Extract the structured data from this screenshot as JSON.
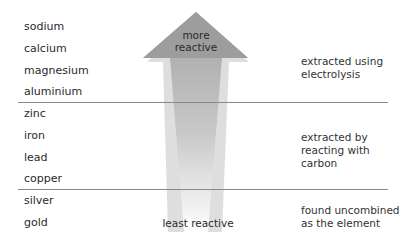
{
  "metals": [
    "sodium",
    "calcium",
    "magnesium",
    "aluminium",
    "zinc",
    "iron",
    "lead",
    "copper",
    "silver",
    "gold"
  ],
  "arrow": {
    "top_label_line1": "more",
    "top_label_line2": "reactive",
    "bottom_label": "least reactive"
  },
  "groups": [
    {
      "line1": "extracted using",
      "line2": "electrolysis"
    },
    {
      "line1": "extracted by",
      "line2": "reacting with",
      "line3": "carbon"
    },
    {
      "line1": "found uncombined",
      "line2": "as the element"
    }
  ],
  "colors": {
    "arrow_top": "#9a9a9a",
    "arrow_bottom": "#ffffff",
    "divider": "#8a8a8a"
  }
}
